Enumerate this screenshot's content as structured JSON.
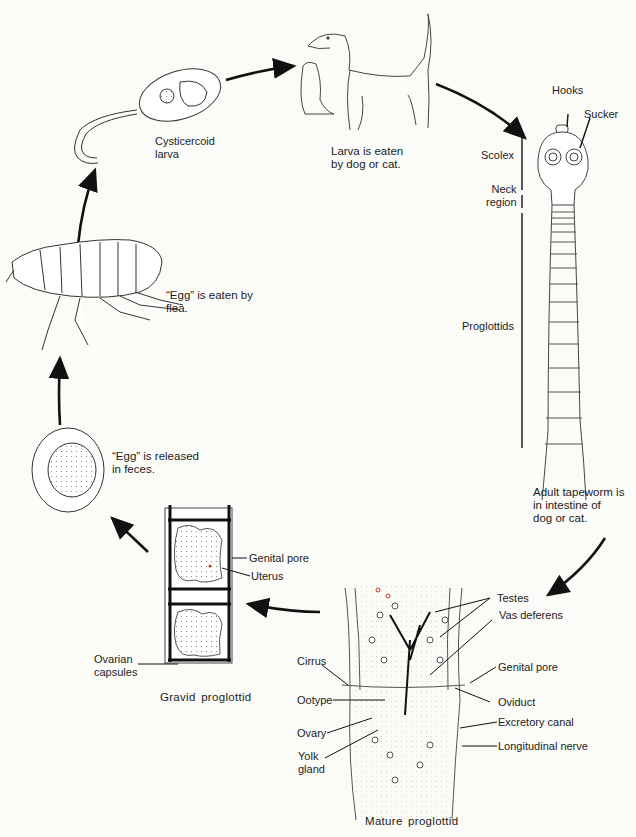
{
  "stages": {
    "cysticercoid": {
      "label": "Cysticercoid\nlarva"
    },
    "host": {
      "label": "Larva is eaten\nby dog or cat."
    },
    "adult": {
      "label": "Adult tapeworm is\nin intestine of\ndog or cat."
    },
    "flea": {
      "label": "“Egg” is eaten by\nflea."
    },
    "egg": {
      "label": "“Egg” is released\nin feces."
    },
    "gravid": {
      "caption": "Gravid proglottid"
    },
    "mature": {
      "caption": "Mature proglottid"
    }
  },
  "adult_labels": {
    "hooks": "Hooks",
    "sucker": "Sucker",
    "scolex": "Scolex",
    "neck": "Neck\nregion",
    "proglottids": "Proglottids"
  },
  "gravid_labels": {
    "genital_pore": "Genital pore",
    "uterus": "Uterus",
    "ovarian_capsules": "Ovarian\ncapsules"
  },
  "mature_labels": {
    "testes": "Testes",
    "vas_deferens": "Vas deferens",
    "cirrus": "Cirrus",
    "genital_pore": "Genital pore",
    "ootype": "Ootype",
    "oviduct": "Oviduct",
    "ovary": "Ovary",
    "excretory_canal": "Excretory canal",
    "yolk_gland": "Yolk\ngland",
    "longitudinal_nerve": "Longitudinal nerve"
  },
  "colors": {
    "ink": "#1a1a1a",
    "paper": "#fbfbf8",
    "stipple": "#8a8a8a",
    "accent_red": "#c0392b"
  }
}
